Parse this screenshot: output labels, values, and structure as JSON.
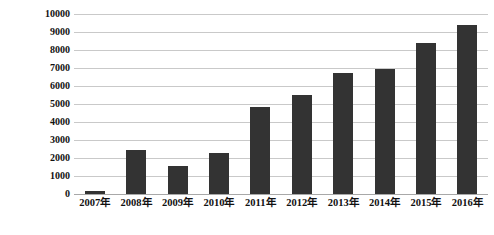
{
  "chart_data": {
    "type": "bar",
    "title": "",
    "subtitle": "",
    "xlabel": "",
    "ylabel": "收费站年平均日交通量(辆/日)",
    "categories": [
      "2007年",
      "2008年",
      "2009年",
      "2010年",
      "2011年",
      "2012年",
      "2013年",
      "2014年",
      "2015年",
      "2016年"
    ],
    "values": [
      150,
      2430,
      1580,
      2290,
      4850,
      5480,
      6750,
      6920,
      8400,
      9400
    ],
    "series": [
      {
        "name": "收费站年平均日交通量",
        "values": [
          150,
          2430,
          1580,
          2290,
          4850,
          5480,
          6750,
          6920,
          8400,
          9400
        ]
      }
    ],
    "ylim": [
      0,
      10000
    ],
    "ytick_labels": [
      "0",
      "1000",
      "2000",
      "3000",
      "4000",
      "5000",
      "6000",
      "7000",
      "8000",
      "9000",
      "10000"
    ],
    "ytick_values": [
      0,
      1000,
      2000,
      3000,
      4000,
      5000,
      6000,
      7000,
      8000,
      9000,
      10000
    ],
    "grid": true,
    "grid_axis": "y",
    "legend": false,
    "legend_position": "none",
    "bar_color": "#333333",
    "grid_color": "#c9c9c9",
    "background_color": "#ffffff",
    "text_color": "#111111",
    "annotations": []
  }
}
